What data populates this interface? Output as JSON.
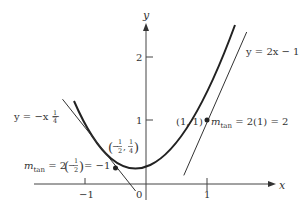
{
  "figure": {
    "axes": {
      "x_label": "x",
      "y_label": "y",
      "x_ticks": [
        {
          "value": -1,
          "label": "−1"
        },
        {
          "value": 0,
          "label": "0"
        },
        {
          "value": 1,
          "label": "1"
        }
      ],
      "y_ticks": [
        {
          "value": 1,
          "label": "1"
        },
        {
          "value": 2,
          "label": "2"
        }
      ]
    },
    "curve": {
      "equation": "y = x²"
    },
    "tangent_right": {
      "label": "y = 2x − 1",
      "point_label": "(1, 1)",
      "slope_label": "m_tan = 2(1) = 2",
      "slope_prefix": "m",
      "slope_sub": "tan",
      "slope_rest": " = 2(1) = 2"
    },
    "tangent_left": {
      "label_prefix": "y = −x − ",
      "label_frac_num": "1",
      "label_frac_den": "4",
      "point_label_open": "(",
      "point_x_sign": "−",
      "point_x_num": "1",
      "point_x_den": "2",
      "point_sep": ",",
      "point_y_num": "1",
      "point_y_den": "4",
      "point_label_close": ")",
      "slope_prefix": "m",
      "slope_sub": "tan",
      "slope_mid": " = 2",
      "slope_paren_open": "(",
      "slope_sign": "−",
      "slope_num": "1",
      "slope_den": "2",
      "slope_paren_close": ")",
      "slope_rest": " = −1"
    }
  }
}
